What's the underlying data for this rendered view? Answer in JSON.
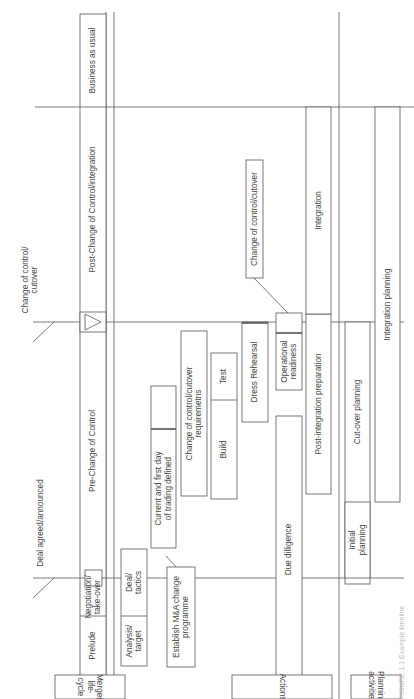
{
  "milestones": {
    "deal_agreed": "Deal agreed/announced",
    "change_of_control": "Change of control/\ncutover"
  },
  "lanes": {
    "merger_lifecycle": "Merger\nlife-cycle",
    "actions": "Actions",
    "planning": "Planning\nactivities"
  },
  "lifecycle": {
    "prelude": "Prelude",
    "negotiation": "Negotiation/\ntake-over",
    "pre_change": "Pre-Change of Control",
    "post_change": "Post-Change of Control/integration",
    "business_as_usual": "Business as usual"
  },
  "actions": {
    "analysis": "Analysis/\ntarget",
    "deal_tactics": "Deal/\ntactics",
    "establish": "Establish M&A change\nprogramme",
    "current_first_day": "Current and first day\nof trading defined",
    "requirements": "Change of control/cutover\nrequiremetns",
    "build": "Build",
    "test": "Test",
    "dress_rehearsal": "Dress Rehearsal",
    "operational_readiness": "Operational\nreadiness",
    "change_callout": "Change of control/cutover",
    "due_diligence": "Due dilligence",
    "post_integration_prep": "Post-integration preparation",
    "integration": "Integration"
  },
  "planning": {
    "initial": "Initial\nplanning",
    "cutover": "Cut-over planning",
    "integration_planning": "Integration planning"
  },
  "caption": "FIGURE 1.1  Example timeline"
}
